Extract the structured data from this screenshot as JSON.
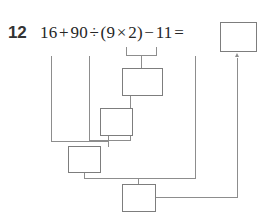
{
  "worksheet": {
    "problem_number": "12",
    "equation": "16 + 90 ÷ (9 × 2) − 11 =",
    "equation_parts": {
      "operand_1": "16",
      "operator_1": "+",
      "operand_2": "90",
      "operator_2": "÷",
      "open_paren": "(",
      "operand_3": "9",
      "operator_3": "×",
      "operand_4": "2",
      "close_paren": ")",
      "operator_4": "−",
      "operand_5": "11",
      "equals": "="
    },
    "answer_box_value": "",
    "work_boxes": [
      {
        "label": "step-1-parentheses",
        "value": ""
      },
      {
        "label": "step-2-division",
        "value": ""
      },
      {
        "label": "step-3-addition",
        "value": ""
      },
      {
        "label": "step-4-subtraction",
        "value": ""
      }
    ],
    "colors": {
      "ink": "#262626",
      "number_ink": "#333333",
      "box_border": "#7d7d7d",
      "connector": "#8d8d8d",
      "paper": "#ffffff"
    },
    "icon_names": {
      "result_arrow": "arrow-up-icon"
    }
  }
}
